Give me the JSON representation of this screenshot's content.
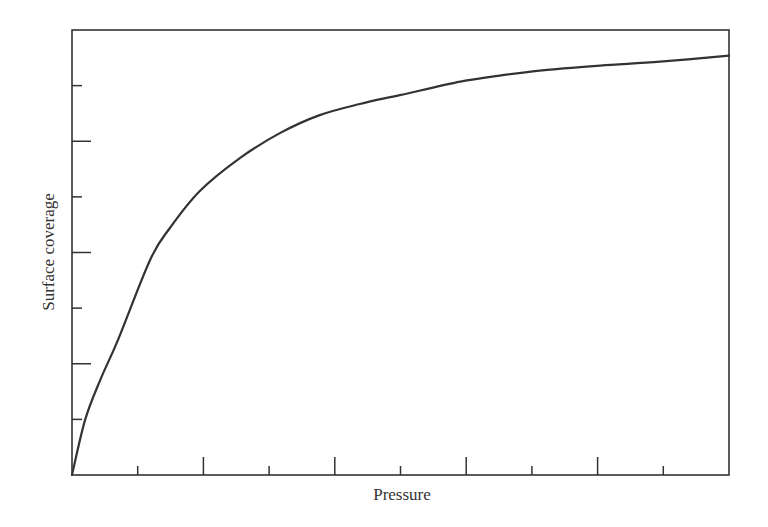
{
  "chart_data": {
    "type": "line",
    "title": "",
    "xlabel": "Pressure",
    "ylabel": "Surface coverage",
    "xlim": [
      0,
      10
    ],
    "ylim": [
      0,
      8
    ],
    "grid": false,
    "legend": null,
    "x_ticks": [
      1,
      2,
      3,
      4,
      5,
      6,
      7,
      8,
      9
    ],
    "x_major_ticks": [
      2,
      4,
      6,
      8
    ],
    "y_ticks": [
      1,
      2,
      3,
      4,
      5,
      6,
      7
    ],
    "y_major_ticks": [
      2,
      4,
      6
    ],
    "tick_labels_shown": false,
    "series": [
      {
        "name": "Surface coverage vs pressure",
        "color": "#333333",
        "x": [
          0,
          0.2,
          0.43,
          0.7,
          1.19,
          1.49,
          1.95,
          2.56,
          3.17,
          3.77,
          4.38,
          4.99,
          5.91,
          6.51,
          7.12,
          8.04,
          8.95,
          10
        ],
        "y": [
          0,
          0.99,
          1.71,
          2.43,
          3.87,
          4.44,
          5.11,
          5.7,
          6.15,
          6.47,
          6.67,
          6.83,
          7.07,
          7.18,
          7.27,
          7.36,
          7.43,
          7.54
        ]
      }
    ]
  },
  "colors": {
    "axis": "#333333",
    "curve": "#333333",
    "background": "#ffffff"
  }
}
